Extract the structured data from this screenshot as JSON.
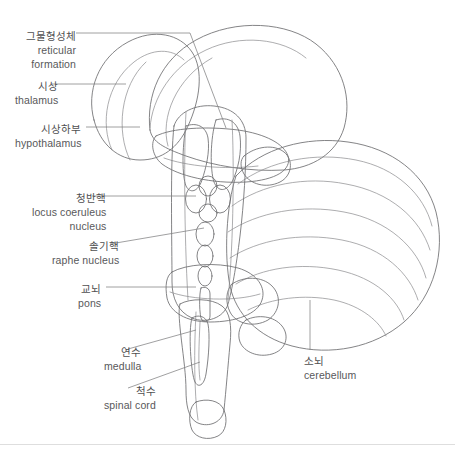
{
  "figure": {
    "style": "line drawing with gray shading",
    "colors": {
      "background": "#ffffff",
      "outline": "#6e6e70",
      "fold_line": "#8a8a8c",
      "leader_line": "#808082",
      "text": "#58585a",
      "shade_light": "#f2f2f2",
      "shade_mid": "#d8d8d8",
      "shade_dark": "#a8a8a8",
      "divider": "#dedede"
    }
  },
  "labels": [
    {
      "id": "reticular-formation",
      "ko": "그물형성체",
      "en_line1": "reticular",
      "en_line2": "formation",
      "align": "right",
      "x": 15,
      "y": 30
    },
    {
      "id": "thalamus",
      "ko": "시상",
      "en_line1": "thalamus",
      "en_line2": "",
      "align": "right",
      "x": 15,
      "y": 80
    },
    {
      "id": "hypothalamus",
      "ko": "시상하부",
      "en_line1": "hypothalamus",
      "en_line2": "",
      "align": "right",
      "x": 15,
      "y": 123
    },
    {
      "id": "locus-coeruleus-nucleus",
      "ko": "청반핵",
      "en_line1": "locus coeruleus",
      "en_line2": "nucleus",
      "align": "right",
      "x": 32,
      "y": 192
    },
    {
      "id": "raphe-nucleus",
      "ko": "솔기핵",
      "en_line1": "raphe nucleus",
      "en_line2": "",
      "align": "right",
      "x": 52,
      "y": 240
    },
    {
      "id": "pons",
      "ko": "교뇌",
      "en_line1": "pons",
      "en_line2": "",
      "align": "right",
      "x": 78,
      "y": 283
    },
    {
      "id": "medulla",
      "ko": "연수",
      "en_line1": "medulla",
      "en_line2": "",
      "align": "right",
      "x": 104,
      "y": 346
    },
    {
      "id": "spinal-cord",
      "ko": "척수",
      "en_line1": "spinal cord",
      "en_line2": "",
      "align": "right",
      "x": 104,
      "y": 385
    },
    {
      "id": "cerebellum",
      "ko": "소뇌",
      "en_line1": "cerebellum",
      "en_line2": "",
      "align": "left",
      "x": 304,
      "y": 355
    }
  ],
  "structures": [
    {
      "id": "cerebrum-outline",
      "name": "cerebral hemisphere outline"
    },
    {
      "id": "thalamus-body",
      "name": "thalamus"
    },
    {
      "id": "hypothalamus-body",
      "name": "hypothalamus"
    },
    {
      "id": "brainstem-column",
      "name": "brainstem"
    },
    {
      "id": "locus-coeruleus-nuclei",
      "name": "locus coeruleus nuclei ovals"
    },
    {
      "id": "raphe-nuclei-chain",
      "name": "raphe nuclei chain"
    },
    {
      "id": "pons-body",
      "name": "pons"
    },
    {
      "id": "medulla-body",
      "name": "medulla oblongata"
    },
    {
      "id": "spinal-cord-body",
      "name": "spinal cord"
    },
    {
      "id": "cerebellum-body",
      "name": "cerebellum with folia"
    }
  ]
}
